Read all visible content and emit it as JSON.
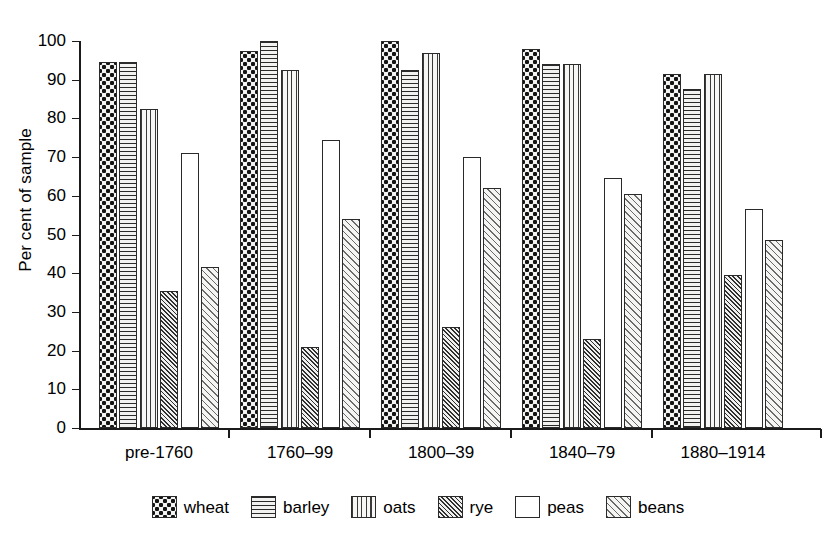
{
  "chart_data": {
    "type": "bar",
    "title": "",
    "xlabel": "",
    "ylabel": "Per cent of sample",
    "ylim": [
      0,
      100
    ],
    "ytick_step": 10,
    "yticks": [
      100,
      90,
      80,
      70,
      60,
      50,
      40,
      30,
      20,
      10,
      0
    ],
    "grid": false,
    "legend_position": "bottom",
    "categories": [
      "pre-1760",
      "1760–99",
      "1800–39",
      "1840–79",
      "1880–1914"
    ],
    "series": [
      {
        "name": "wheat",
        "pattern": "checkerboard-dots",
        "values": [
          94.5,
          97.5,
          100.0,
          98.0,
          91.5
        ]
      },
      {
        "name": "barley",
        "pattern": "horizontal-lines",
        "values": [
          94.5,
          100.0,
          92.5,
          94.0,
          87.5
        ]
      },
      {
        "name": "oats",
        "pattern": "vertical-lines",
        "values": [
          82.5,
          92.5,
          97.0,
          94.0,
          91.5
        ]
      },
      {
        "name": "rye",
        "pattern": "dense-diagonal",
        "values": [
          35.5,
          21.0,
          26.0,
          23.0,
          39.5
        ]
      },
      {
        "name": "peas",
        "pattern": "solid-white",
        "values": [
          71.0,
          74.5,
          70.0,
          64.5,
          56.5
        ]
      },
      {
        "name": "beans",
        "pattern": "sparse-diagonal",
        "values": [
          41.5,
          54.0,
          62.0,
          60.5,
          48.5
        ]
      }
    ]
  },
  "legend": {
    "items": [
      {
        "label": "wheat"
      },
      {
        "label": "barley"
      },
      {
        "label": "oats"
      },
      {
        "label": "rye"
      },
      {
        "label": "peas"
      },
      {
        "label": "beans"
      }
    ]
  },
  "colors": {
    "axis": "#1b1b1b",
    "bar_outline": "#2a2a2a",
    "background": "#ffffff",
    "pattern_ink": "#2b2b2b"
  }
}
